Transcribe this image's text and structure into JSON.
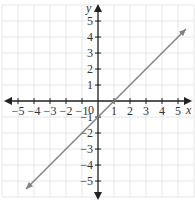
{
  "chart_data": {
    "type": "line",
    "title": "",
    "xlabel": "x",
    "ylabel": "y",
    "xlim": [
      -5.5,
      5.5
    ],
    "ylim": [
      -5.5,
      5.5
    ],
    "grid": true,
    "x_ticks": [
      "-5",
      "-4",
      "-3",
      "-2",
      "-1",
      "1",
      "2",
      "3",
      "4",
      "5"
    ],
    "y_ticks": [
      "5",
      "4",
      "3",
      "2",
      "1",
      "-1",
      "-2",
      "-3",
      "-4",
      "-5"
    ],
    "origin_label": "0",
    "series": [
      {
        "name": "y = x - 1",
        "x": [
          -4.5,
          5.5
        ],
        "y": [
          -5.5,
          4.5
        ],
        "color": "#808080",
        "arrows": "both"
      }
    ]
  },
  "labels": {
    "x_axis": "x",
    "y_axis": "y",
    "origin": "0"
  }
}
